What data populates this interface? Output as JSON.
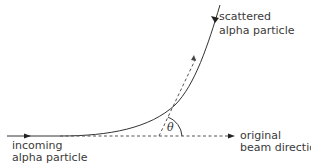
{
  "diagram": {
    "type": "rutherford-scattering",
    "labels": {
      "scattered_line1": "scattered",
      "scattered_line2": "alpha particle",
      "incoming_line1": "incoming",
      "incoming_line2": "alpha particle",
      "original_line1": "original",
      "original_line2": "beam direction",
      "angle": "θ"
    },
    "colors": {
      "line": "#333333",
      "dashed": "#555555",
      "text": "#3a3a3a"
    }
  }
}
